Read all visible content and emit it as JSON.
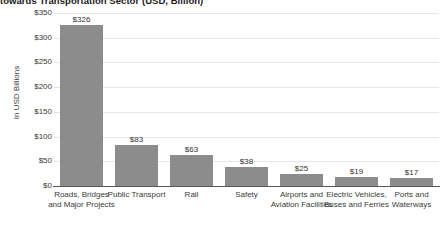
{
  "chart_data": {
    "type": "bar",
    "title": "towards Transportation Sector (USD, Billion)",
    "xlabel": "",
    "ylabel": "In USD Billions",
    "ylim": [
      0,
      350
    ],
    "ytick_step": 50,
    "grid": true,
    "legend": "none",
    "value_prefix": "$",
    "bar_color": "#8c8c8c",
    "gridline_color": "#e6e6e6",
    "axis_color": "#595959",
    "categories": [
      "Roads, Bridges and Major Projects",
      "Public Transport",
      "Rail",
      "Safety",
      "Airports and Aviation Facilities",
      "Electric Vehicles, Buses and Ferries",
      "Ports and Waterways"
    ],
    "values": [
      326,
      83,
      63,
      38,
      25,
      19,
      17
    ],
    "data_labels": [
      "$326",
      "$83",
      "$63",
      "$38",
      "$25",
      "$19",
      "$17"
    ],
    "ytick_labels": [
      "$350",
      "$300",
      "$250",
      "$200",
      "$150",
      "$100",
      "$50",
      "$0"
    ],
    "ytick_values": [
      350,
      300,
      250,
      200,
      150,
      100,
      50,
      0
    ]
  }
}
